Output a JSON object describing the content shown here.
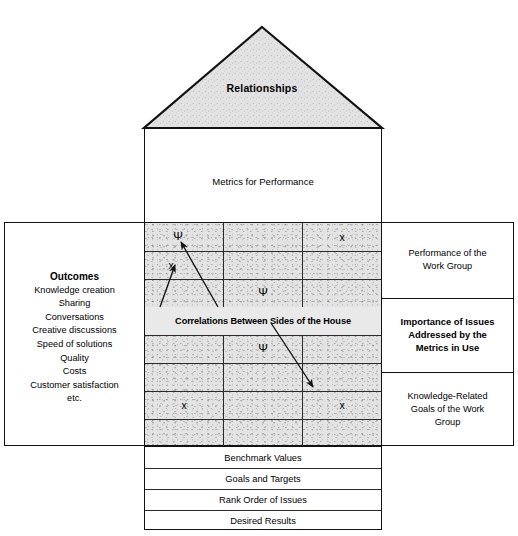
{
  "diagram": {
    "roof": {
      "label": "Relationships",
      "fill": "#e3e3e3",
      "stroke": "#121212"
    },
    "attic": {
      "label": "Metrics for Performance"
    },
    "left_panel": {
      "title": "Outcomes",
      "items": [
        "Knowledge creation",
        "Sharing",
        "Conversations",
        "Creative discussions",
        "Speed of solutions",
        "Quality",
        "Costs",
        "Customer satisfaction",
        "etc."
      ]
    },
    "center_grid": {
      "columns": 3,
      "rows": 8,
      "fill": "#e3e3e3",
      "cells": [
        [
          "Ψ",
          "",
          "x"
        ],
        [
          "x",
          "",
          ""
        ],
        [
          "",
          "Ψ",
          ""
        ],
        [
          "",
          "",
          ""
        ],
        [
          "",
          "Ψ",
          ""
        ],
        [
          "",
          "",
          ""
        ],
        [
          "x",
          "",
          "x"
        ],
        [
          "",
          "",
          ""
        ]
      ],
      "banner_label": "Correlations Between Sides of the House",
      "banner_row_index": 4,
      "arrows": [
        {
          "name": "arrow-to-psi-top-left",
          "x1": 218,
          "y1": 307,
          "x2": 181,
          "y2": 242
        },
        {
          "name": "arrow-to-x-upper-left",
          "x1": 160,
          "y1": 307,
          "x2": 175,
          "y2": 265
        },
        {
          "name": "arrow-to-x-lower-right",
          "x1": 271,
          "y1": 323,
          "x2": 313,
          "y2": 387
        }
      ]
    },
    "right_panel": {
      "sections": [
        {
          "label": "Performance of the\nWork Group",
          "bold": false
        },
        {
          "label": "Importance of Issues\nAddressed by the\nMetrics in Use",
          "bold": true
        },
        {
          "label": "Knowledge-Related\nGoals of the Work\nGroup",
          "bold": false
        }
      ]
    },
    "bottom_rows": [
      "Benchmark Values",
      "Goals and Targets",
      "Rank Order of Issues",
      "Desired Results"
    ]
  }
}
